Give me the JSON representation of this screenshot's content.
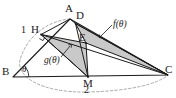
{
  "figure": {
    "type": "geometry-diagram",
    "width": 176,
    "height": 98,
    "colors": {
      "stroke": "#1a1a1a",
      "shade_fill": "#c9c9c9",
      "dash_stroke": "#9a9a9a",
      "background": "#ffffff",
      "label": "#1a1a1a"
    },
    "points": {
      "A": {
        "label": "A",
        "x": 70.0,
        "y": 19.0,
        "label_x": 66.0,
        "label_y": 5.0
      },
      "D": {
        "label": "D",
        "x": 75.5,
        "y": 23.5,
        "label_x": 76.0,
        "label_y": 11.0
      },
      "H": {
        "label": "H",
        "x": 41.0,
        "y": 34.5,
        "label_x": 34.0,
        "label_y": 25.0
      },
      "E": {
        "label": "E",
        "x": 86.0,
        "y": 43.0,
        "label_x": 80.0,
        "label_y": 37.0
      },
      "B": {
        "label": "B",
        "x": 13.0,
        "y": 77.0,
        "label_x": 3.0,
        "label_y": 66.0
      },
      "M": {
        "label": "M",
        "x": 88.0,
        "y": 77.0,
        "label_x": 83.0,
        "label_y": 79.0
      },
      "C": {
        "label": "C",
        "x": 168.0,
        "y": 75.0,
        "label_x": 165.0,
        "label_y": 65.0
      }
    },
    "segments": [
      {
        "name": "side-BA",
        "from": "B",
        "to": "A"
      },
      {
        "name": "side-BC",
        "from": "B",
        "to": "C"
      },
      {
        "name": "side-AC",
        "from": "A",
        "to": "C"
      },
      {
        "name": "cevian-DC",
        "from": "D",
        "to": "C"
      },
      {
        "name": "cevian-DM",
        "from": "D",
        "to": "M"
      },
      {
        "name": "cevian-HC",
        "from": "H",
        "to": "C"
      },
      {
        "name": "cevian-HM",
        "from": "H",
        "to": "M"
      },
      {
        "name": "segment-AD",
        "from": "A",
        "to": "D"
      },
      {
        "name": "segment-AH",
        "from": "A",
        "to": "H"
      }
    ],
    "shaded_regions": [
      {
        "name": "region-f-theta",
        "vertices": "D,E,C",
        "label": "f(θ)"
      },
      {
        "name": "region-g-theta",
        "vertices": "H,E,M",
        "label": "g(θ)"
      }
    ],
    "labels": {
      "point_A": "A",
      "point_D": "D",
      "point_H": "H",
      "point_E": "E",
      "point_B": "B",
      "point_M": "M",
      "point_C": "C",
      "length_one": "1",
      "length_two": "2",
      "angle_theta": "θ",
      "func_f": "f(θ)",
      "func_g": "g(θ)"
    },
    "label_positions": {
      "length_one": {
        "x": 22.0,
        "y": 26.0
      },
      "length_two": {
        "x": 85.0,
        "y": 86.0
      },
      "angle_theta": {
        "x": 22.0,
        "y": 66.0
      },
      "func_f": {
        "x": 115.0,
        "y": 26.0
      },
      "func_g": {
        "x": 48.0,
        "y": 60.0
      }
    },
    "marks": {
      "right_angle_at_H": true,
      "angle_arc_at_B": true,
      "dashed_arc": "arc through A around B and C",
      "leader_f": {
        "from_x": 107.0,
        "from_y": 32.0,
        "to_x": 100.0,
        "to_y": 37.0
      },
      "leader_g": {
        "from_x": 62.0,
        "from_y": 55.0,
        "to_x": 69.0,
        "to_y": 47.0
      }
    }
  }
}
